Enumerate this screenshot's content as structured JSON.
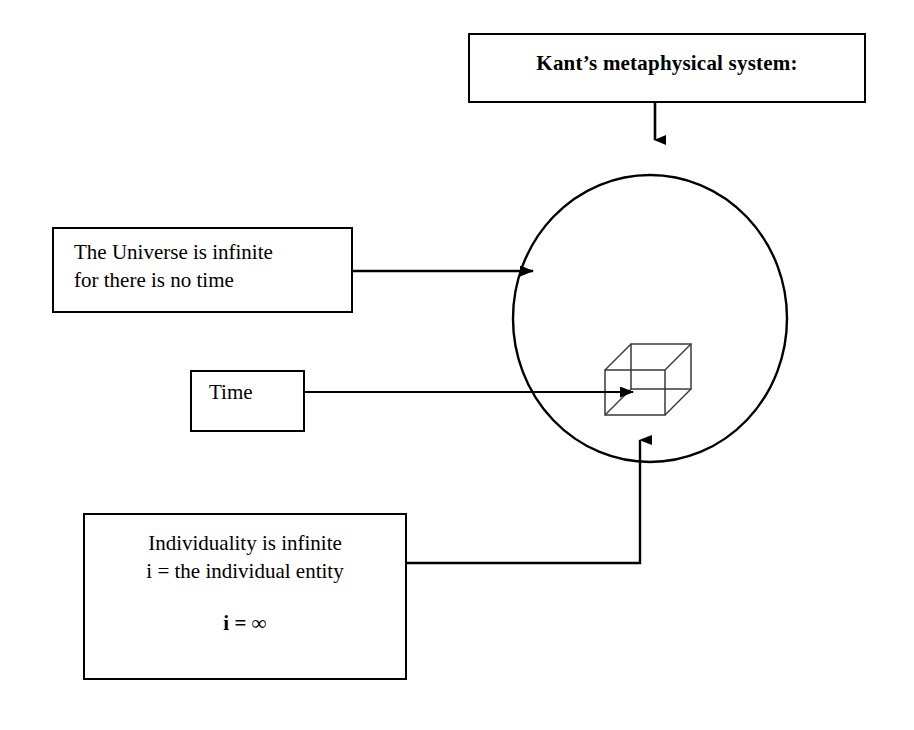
{
  "diagram": {
    "title_box": {
      "label": "Kant’s metaphysical system:"
    },
    "universe_box": {
      "label": "The Universe is infinite\nfor there is no time"
    },
    "time_box": {
      "label": "Time"
    },
    "individuality_box": {
      "label": "Individuality is infinite\ni = the individual entity",
      "formula": "i = ∞"
    },
    "shapes": {
      "circle_name": "universe-circle",
      "cube_name": "wireframe-cube"
    },
    "arrows": {
      "title_to_circle": "arrow-down-into-circle",
      "universe_to_circle": "arrow-right-into-circle",
      "time_to_cube": "arrow-right-into-cube",
      "individuality_to_cube": "arrow-up-into-cube"
    },
    "colors": {
      "stroke": "#000000",
      "background": "#ffffff",
      "cube_stroke": "#333333"
    }
  }
}
